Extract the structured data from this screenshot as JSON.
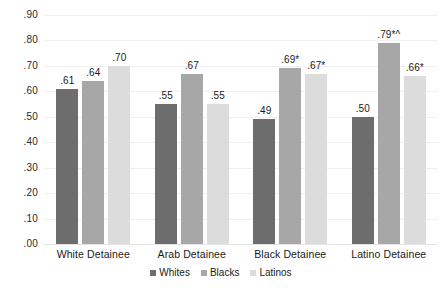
{
  "chart_data": {
    "type": "bar",
    "title": "",
    "subtitle": "",
    "xlabel": "",
    "ylabel": "",
    "ylim": [
      0.0,
      0.9
    ],
    "ytick_labels": [
      ".90",
      ".80",
      ".70",
      ".60",
      ".50",
      ".40",
      ".30",
      ".20",
      ".10",
      ".00"
    ],
    "ytick_values": [
      0.9,
      0.8,
      0.7,
      0.6,
      0.5,
      0.4,
      0.3,
      0.2,
      0.1,
      0.0
    ],
    "grid": true,
    "legend_position": "bottom",
    "categories": [
      "White Detainee",
      "Arab Detainee",
      "Black Detainee",
      "Latino Detainee"
    ],
    "series": [
      {
        "name": "Whites",
        "color": "#6d6d6d",
        "values": [
          0.61,
          0.55,
          0.49,
          0.5
        ],
        "labels": [
          ".61",
          ".55",
          ".49",
          ".50"
        ]
      },
      {
        "name": "Blacks",
        "color": "#a7a7a7",
        "values": [
          0.64,
          0.67,
          0.69,
          0.79
        ],
        "labels": [
          ".64",
          ".67",
          ".69*",
          ".79*^"
        ]
      },
      {
        "name": "Latinos",
        "color": "#dcdcdc",
        "values": [
          0.7,
          0.55,
          0.67,
          0.66
        ],
        "labels": [
          ".70",
          ".55",
          ".67*",
          ".66*"
        ]
      }
    ]
  }
}
